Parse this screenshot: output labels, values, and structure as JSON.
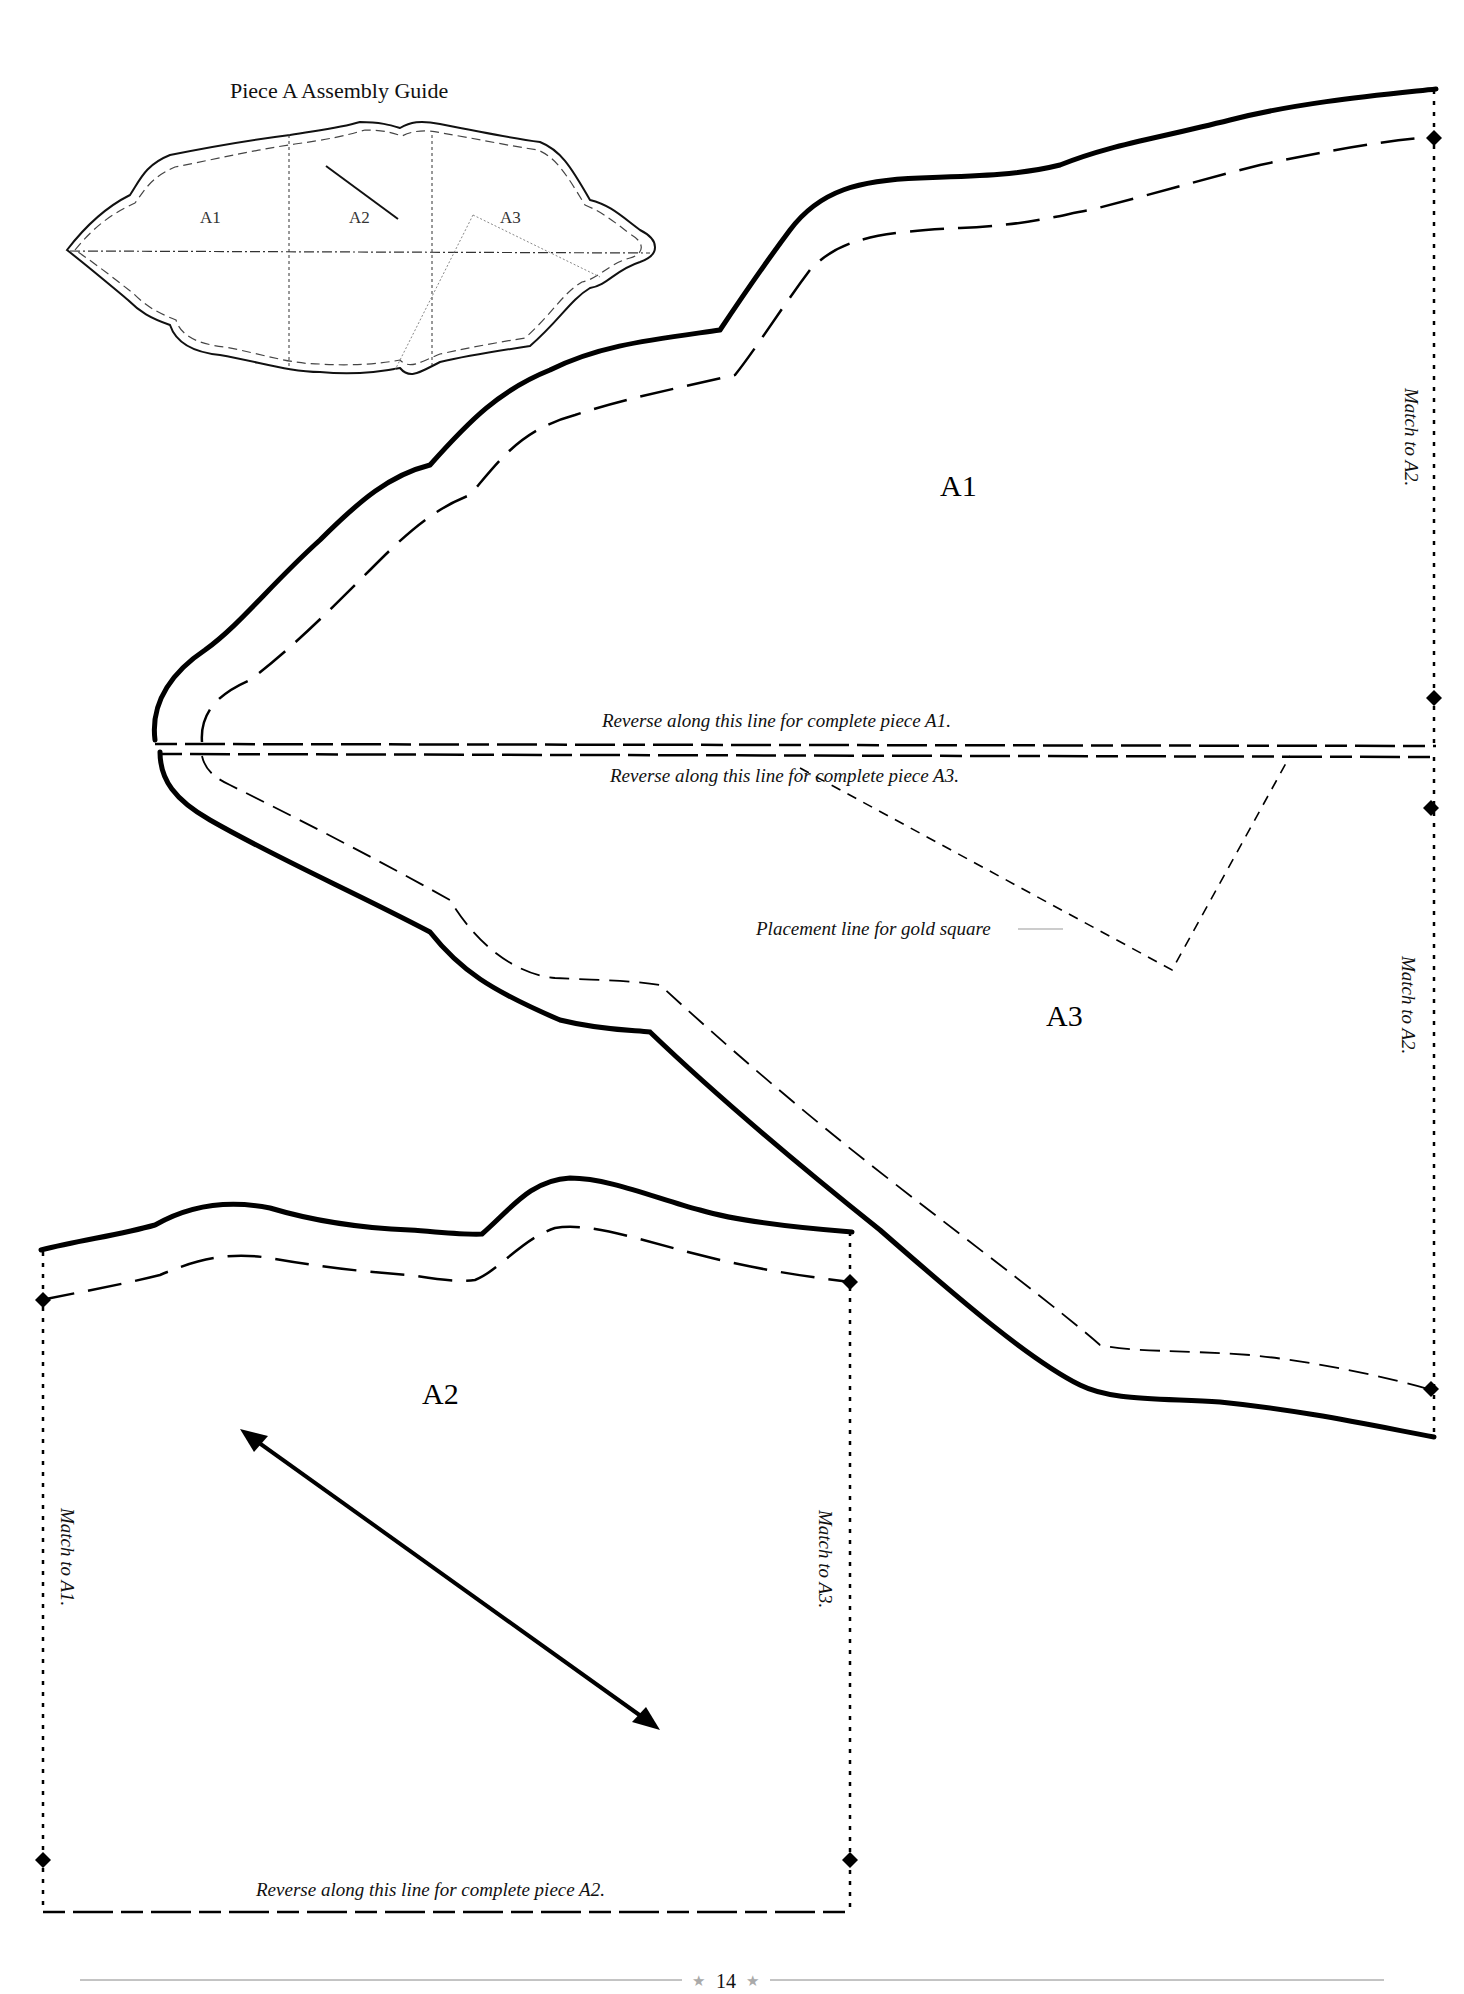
{
  "assembly_guide": {
    "title": "Piece A Assembly Guide",
    "labels": [
      "A1",
      "A2",
      "A3"
    ]
  },
  "pieces": {
    "a1": {
      "label": "A1",
      "reverse_note": "Reverse along this line for complete piece A1.",
      "match_note": "Match to A2."
    },
    "a3": {
      "label": "A3",
      "reverse_note": "Reverse along this line for complete piece A3.",
      "placement_note": "Placement line for gold square",
      "match_note": "Match to A2."
    },
    "a2": {
      "label": "A2",
      "reverse_note": "Reverse along this line for complete piece A2.",
      "match_left_note": "Match to A1.",
      "match_right_note": "Match to A3."
    }
  },
  "footer": {
    "page_number": "14",
    "star": "★"
  }
}
